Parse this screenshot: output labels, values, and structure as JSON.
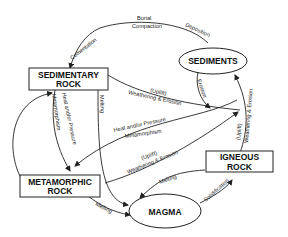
{
  "diagram": {
    "nodes": {
      "sedimentary": {
        "line1": "SEDIMENTARY",
        "line2": "ROCK"
      },
      "sediments": {
        "label": "SEDIMENTS"
      },
      "metamorphic": {
        "line1": "METAMORPHIC",
        "line2": "ROCK"
      },
      "igneous": {
        "line1": "IGNEOUS",
        "line2": "ROCK"
      },
      "magma": {
        "label": "MAGMA"
      }
    },
    "edges": {
      "cementation": "Cementation",
      "burial": "Burial",
      "compaction": "Compaction",
      "deposition": "Deposition",
      "erosion": "Erosion",
      "sed_uplift": "(Uplift)",
      "sed_weathering": "Weathering & Erosion",
      "heat_pressure_down": "Heat and/or Pressure",
      "metamorphism_down": "Metamorphism",
      "melting_sed": "Melting",
      "heat_pressure_ig": "Heat and/or Pressure",
      "metamorphism_ig": "Metamorphism",
      "meta_uplift": "(Uplift)",
      "meta_weathering": "Weathering & Erosion",
      "ig_uplift": "(Uplift)",
      "ig_weathering": "Weathering & Erosion",
      "melting_ig": "Melting",
      "melting_meta": "Melting",
      "solidification": "Solidification"
    }
  }
}
